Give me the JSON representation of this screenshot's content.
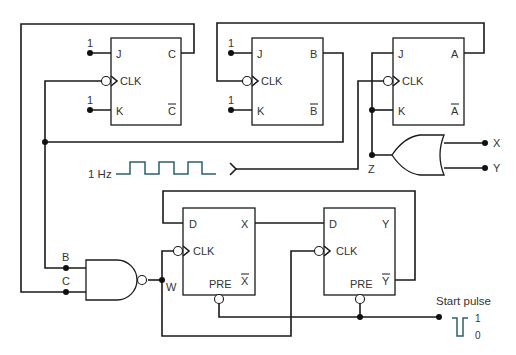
{
  "diagram": {
    "type": "logic-circuit-schematic",
    "jk_flip_flops": [
      {
        "name": "C",
        "pins": {
          "j": "J",
          "k": "K",
          "clk": "CLK",
          "q": "C",
          "qbar": "C"
        },
        "j_level": "1",
        "k_level": "1"
      },
      {
        "name": "B",
        "pins": {
          "j": "J",
          "k": "K",
          "clk": "CLK",
          "q": "B",
          "qbar": "B"
        },
        "j_level": "1",
        "k_level": "1"
      },
      {
        "name": "A",
        "pins": {
          "j": "J",
          "k": "K",
          "clk": "CLK",
          "q": "A",
          "qbar": "A"
        }
      }
    ],
    "d_flip_flops": [
      {
        "name": "X",
        "pins": {
          "d": "D",
          "clk": "CLK",
          "q": "X",
          "qbar": "X",
          "pre": "PRE"
        }
      },
      {
        "name": "Y",
        "pins": {
          "d": "D",
          "clk": "CLK",
          "q": "Y",
          "qbar": "Y",
          "pre": "PRE"
        }
      }
    ],
    "clock": {
      "label": "1 Hz"
    },
    "or_gate": {
      "input_label": "Z",
      "outputs": [
        "X",
        "Y"
      ]
    },
    "nand_gate": {
      "inputs": [
        "B",
        "C"
      ],
      "output_label": "W"
    },
    "start_pulse": {
      "label": "Start pulse",
      "high": "1",
      "low": "0"
    },
    "colors": {
      "wire": "#1a1a1a",
      "text": "#333333",
      "clock_wave": "#2c5f6a"
    }
  }
}
